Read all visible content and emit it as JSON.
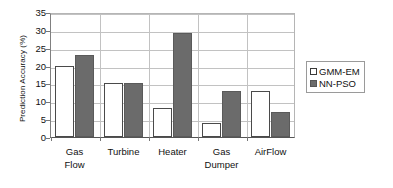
{
  "chart_data": {
    "type": "bar",
    "title": "",
    "xlabel": "",
    "ylabel": "Prediction Accuracy (%)",
    "categories": [
      "Gas\nFlow",
      "Turbine",
      "Heater",
      "Gas\nDumper",
      "AirFlow"
    ],
    "series": [
      {
        "name": "GMM-EM",
        "values": [
          20,
          15,
          8,
          4,
          13
        ],
        "color": "#ffffff"
      },
      {
        "name": "NN-PSO",
        "values": [
          23,
          15,
          29,
          13,
          7
        ],
        "color": "#6b6b6b"
      }
    ],
    "ylim": [
      0,
      35
    ],
    "ytick_values": [
      0,
      5,
      10,
      15,
      20,
      25,
      30,
      35
    ],
    "ytick_labels": [
      "0",
      "5",
      "10",
      "15",
      "20",
      "25",
      "30",
      "35"
    ],
    "grid": true,
    "grid_axis": "y",
    "legend_position": "right"
  },
  "legend": {
    "entries": [
      {
        "label": "GMM-EM"
      },
      {
        "label": "NN-PSO"
      }
    ]
  }
}
